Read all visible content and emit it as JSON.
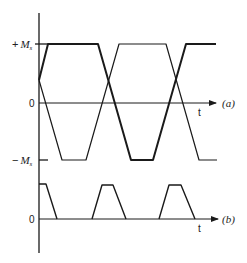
{
  "figure": {
    "colors": {
      "line": "#1a1a1a",
      "text": "#222222",
      "background": "#ffffff"
    },
    "labels": {
      "plus_ms_sign": "+",
      "plus_ms_main": "M",
      "plus_ms_sub": "s",
      "minus_ms_sign": "−",
      "minus_ms_main": "M",
      "minus_ms_sub": "s",
      "zero_a": "0",
      "zero_b": "0",
      "t_a": "t",
      "t_b": "t",
      "panel_a": "(a)",
      "panel_b": "(b)"
    },
    "panel_a": {
      "description": "Two antiphase trapezoidal magnetization waveforms between +Ms and −Ms",
      "levels": [
        "+Ms",
        "0",
        "−Ms"
      ],
      "trace_thick": [
        [
          39,
          80
        ],
        [
          48,
          44
        ],
        [
          98,
          44
        ],
        [
          131,
          160
        ],
        [
          153,
          160
        ],
        [
          186,
          44
        ],
        [
          216,
          44
        ]
      ],
      "trace_thin": [
        [
          39,
          80
        ],
        [
          62,
          160
        ],
        [
          86,
          160
        ],
        [
          119,
          44
        ],
        [
          166,
          44
        ],
        [
          199,
          160
        ],
        [
          217,
          160
        ]
      ]
    },
    "panel_b": {
      "description": "Trapezoidal pulses occurring at the overlap intervals",
      "pulses": [
        [
          [
            39,
            184
          ],
          [
            46,
            184
          ],
          [
            57,
            219
          ]
        ],
        [
          [
            92,
            219
          ],
          [
            102,
            185
          ],
          [
            113,
            185
          ],
          [
            126,
            219
          ]
        ],
        [
          [
            159,
            219
          ],
          [
            169,
            185
          ],
          [
            181,
            185
          ],
          [
            195,
            219
          ]
        ]
      ]
    }
  }
}
